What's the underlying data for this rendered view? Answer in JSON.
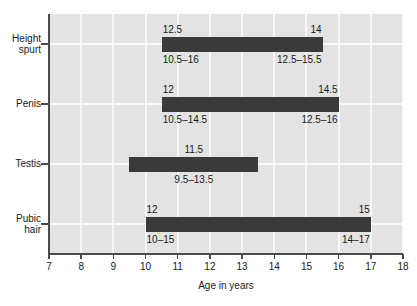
{
  "chart_data": {
    "type": "bar",
    "orientation": "horizontal",
    "subtype": "range-bar",
    "title": "",
    "xlabel": "Age in years",
    "ylabel": "",
    "xlim": [
      7,
      18
    ],
    "xticks": [
      7,
      8,
      9,
      10,
      11,
      12,
      13,
      14,
      15,
      16,
      17,
      18
    ],
    "xticklabels": [
      "7",
      "8",
      "9",
      "10",
      "11",
      "12",
      "13",
      "14",
      "15",
      "16",
      "17",
      "18"
    ],
    "grid": true,
    "legend": "none",
    "categories": [
      "Height spurt",
      "Penis",
      "Testis",
      "Pubic hair"
    ],
    "bars": [
      {
        "category": "Height spurt",
        "category_line1": "Height",
        "category_line2": "spurt",
        "start": 10.5,
        "end": 15.5,
        "labels": [
          {
            "text": "12.5",
            "position": "above-left",
            "value": 12.5
          },
          {
            "text": "14",
            "position": "above-right",
            "value": 14
          },
          {
            "text": "10.5–16",
            "position": "below-left",
            "range": [
              10.5,
              16
            ]
          },
          {
            "text": "12.5–15.5",
            "position": "below-right",
            "range": [
              12.5,
              15.5
            ]
          }
        ]
      },
      {
        "category": "Penis",
        "category_line1": "Penis",
        "category_line2": "",
        "start": 10.5,
        "end": 16.0,
        "labels": [
          {
            "text": "12",
            "position": "above-left",
            "value": 12
          },
          {
            "text": "14.5",
            "position": "above-right",
            "value": 14.5
          },
          {
            "text": "10.5–14.5",
            "position": "below-left",
            "range": [
              10.5,
              14.5
            ]
          },
          {
            "text": "12.5–16",
            "position": "below-right",
            "range": [
              12.5,
              16
            ]
          }
        ]
      },
      {
        "category": "Testis",
        "category_line1": "Testis",
        "category_line2": "",
        "start": 9.5,
        "end": 13.5,
        "labels": [
          {
            "text": "11.5",
            "position": "above-center",
            "value": 11.5
          },
          {
            "text": "9.5–13.5",
            "position": "below-center",
            "range": [
              9.5,
              13.5
            ]
          }
        ]
      },
      {
        "category": "Pubic hair",
        "category_line1": "Pubic",
        "category_line2": "hair",
        "start": 10.0,
        "end": 17.0,
        "labels": [
          {
            "text": "12",
            "position": "above-left",
            "value": 12
          },
          {
            "text": "15",
            "position": "above-right",
            "value": 15
          },
          {
            "text": "10–15",
            "position": "below-left",
            "range": [
              10,
              15
            ]
          },
          {
            "text": "14–17",
            "position": "below-right",
            "range": [
              14,
              17
            ]
          }
        ]
      }
    ],
    "colors": {
      "bar": "#3a3a3a",
      "plot_background": "#e3e3e3",
      "gridline": "#f7f7f7",
      "axis": "#4a4a4a",
      "text": "#1a1a1a",
      "page_background": "#ffffff"
    }
  }
}
